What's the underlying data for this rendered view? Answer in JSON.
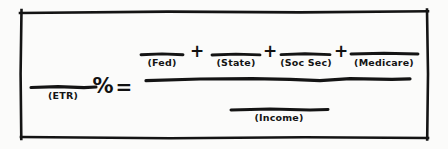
{
  "diagram": {
    "ink_color": "#141414",
    "background_color": "#fbfbfa",
    "frame": {
      "name": "hand-drawn-rectangle-border"
    },
    "equation": {
      "left_side": {
        "blank_name": "etr-blank-line",
        "label": "(ETR)",
        "unit_symbol": "%"
      },
      "relation_symbol": "=",
      "numerator": {
        "terms": [
          {
            "label": "(Fed)"
          },
          {
            "label": "(State)"
          },
          {
            "label": "(Soc Sec)"
          },
          {
            "label": "(Medicare)"
          }
        ],
        "operator": "+"
      },
      "denominator": {
        "terms": [
          {
            "label": "(Income)"
          }
        ]
      }
    }
  }
}
